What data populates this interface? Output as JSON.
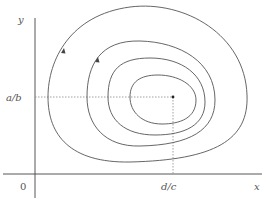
{
  "diagram": {
    "type": "phase-portrait",
    "labels": {
      "y_axis": "y",
      "x_axis": "x",
      "origin": "0",
      "equilibrium_y": "a/b",
      "equilibrium_x": "d/c"
    },
    "equilibrium_point": {
      "x_label": "d/c",
      "y_label": "a/b"
    },
    "orbits": [
      {
        "id": "orbit-1",
        "arrow": true
      },
      {
        "id": "orbit-2",
        "arrow": true
      },
      {
        "id": "orbit-3",
        "arrow": false
      },
      {
        "id": "orbit-4",
        "arrow": false
      }
    ],
    "colors": {
      "curve": "#555555",
      "axis": "#444444",
      "guide": "#888888",
      "point": "#222222"
    }
  }
}
